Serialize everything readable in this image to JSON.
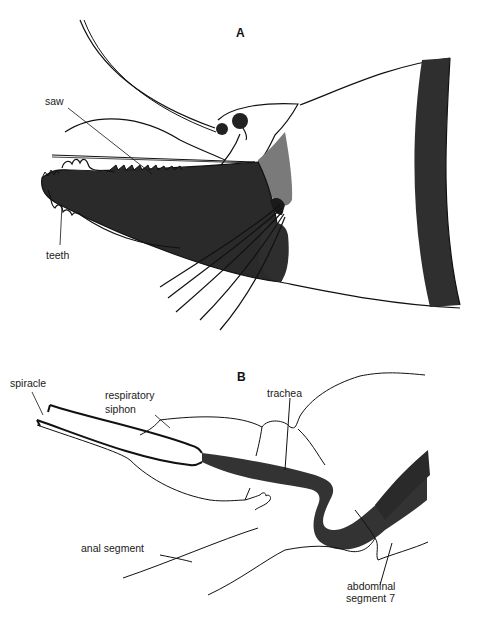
{
  "figure": {
    "panels": [
      {
        "id": "A",
        "label": "A",
        "annotations": [
          {
            "text": "saw"
          },
          {
            "text": "teeth"
          }
        ]
      },
      {
        "id": "B",
        "label": "B",
        "annotations": [
          {
            "text": "spiracle"
          },
          {
            "text": "respiratory"
          },
          {
            "text": "siphon"
          },
          {
            "text": "trachea"
          },
          {
            "text": "anal segment"
          },
          {
            "text": "abdominal"
          },
          {
            "text": "segment 7"
          }
        ]
      }
    ],
    "colors": {
      "ink": "#111111",
      "dark_fill": "#2a2a2a",
      "mid_fill": "#555555",
      "light_fill": "#8a8a8a",
      "background": "#ffffff"
    }
  }
}
